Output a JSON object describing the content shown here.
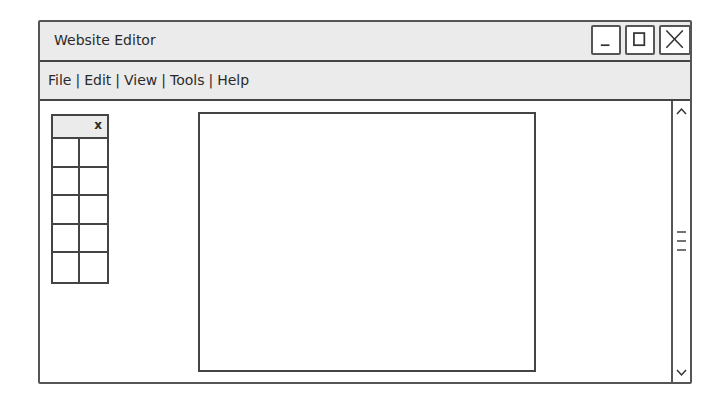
{
  "window": {
    "title": "Website Editor",
    "controls": [
      {
        "name": "minimize",
        "icon": "minimize-icon"
      },
      {
        "name": "maximize",
        "icon": "maximize-icon"
      },
      {
        "name": "close",
        "icon": "close-icon"
      }
    ]
  },
  "menubar": {
    "items": [
      "File",
      "Edit",
      "View",
      "Tools",
      "Help"
    ],
    "separator": "|"
  },
  "palette": {
    "close_label": "x",
    "rows": 5,
    "columns": 2
  },
  "canvas": {},
  "scrollbar": {
    "up_icon": "chevron-up-icon",
    "down_icon": "chevron-down-icon",
    "thumb_icon": "grip-lines-icon"
  },
  "colors": {
    "bar_background": "#ebebeb",
    "border": "#444444",
    "background": "#ffffff"
  }
}
